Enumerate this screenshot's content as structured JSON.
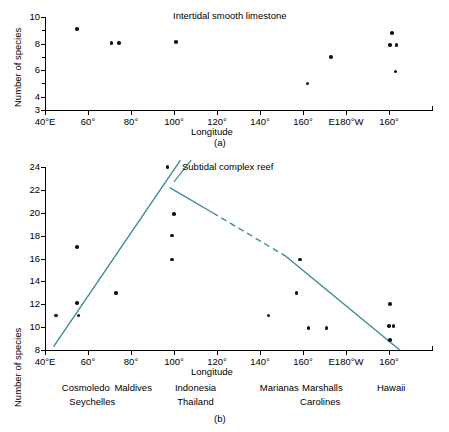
{
  "figure": {
    "panel_a_tag": "(a)",
    "panel_b_tag": "(b)"
  },
  "chart_data": [
    {
      "type": "scatter",
      "id": "panel-a",
      "title": "Intertidal smooth limestone",
      "xlabel": "Longitude",
      "ylabel": "Number of species",
      "xlim": [
        40,
        220
      ],
      "ylim": [
        3,
        10
      ],
      "grid": false,
      "legend": "none",
      "yticks": [
        3,
        4,
        6,
        8,
        10
      ],
      "ytick_labels": [
        "3",
        "4",
        "6",
        "8",
        "10"
      ],
      "yminor": [
        5,
        7,
        9
      ],
      "xticks": [
        40,
        60,
        80,
        100,
        120,
        140,
        160,
        180,
        200
      ],
      "xtick_labels": [
        "40°E",
        "60°",
        "80°",
        "100°",
        "120°",
        "140°",
        "160°",
        "E180°W",
        "160°"
      ],
      "points": [
        {
          "x": 55,
          "y": 9.1
        },
        {
          "x": 71,
          "y": 8.05
        },
        {
          "x": 74.5,
          "y": 8.05
        },
        {
          "x": 101,
          "y": 8.1
        },
        {
          "x": 162,
          "y": 5.0
        },
        {
          "x": 173,
          "y": 7.0
        },
        {
          "x": 201.5,
          "y": 8.8
        },
        {
          "x": 200.5,
          "y": 7.9
        },
        {
          "x": 203.5,
          "y": 7.9
        },
        {
          "x": 203,
          "y": 5.9
        }
      ]
    },
    {
      "type": "scatter",
      "id": "panel-b",
      "title": "Subtidal complex reef",
      "xlabel": "Longitude",
      "ylabel": "Number of species",
      "xlim": [
        40,
        220
      ],
      "ylim": [
        8,
        24
      ],
      "grid": false,
      "legend": "none",
      "yticks": [
        8,
        10,
        12,
        14,
        16,
        18,
        20,
        22,
        24
      ],
      "ytick_labels": [
        "8",
        "10",
        "12",
        "14",
        "16",
        "18",
        "20",
        "22",
        "24"
      ],
      "xticks": [
        40,
        60,
        80,
        100,
        120,
        140,
        160,
        180,
        200
      ],
      "xtick_labels": [
        "40°E",
        "60°",
        "80°",
        "100°",
        "120°",
        "140°",
        "160°",
        "E180°W",
        "160°"
      ],
      "points": [
        {
          "x": 45,
          "y": 11.0
        },
        {
          "x": 55,
          "y": 12.1
        },
        {
          "x": 55.5,
          "y": 11.0
        },
        {
          "x": 55,
          "y": 17.0
        },
        {
          "x": 73,
          "y": 13.0
        },
        {
          "x": 97,
          "y": 24.0
        },
        {
          "x": 100,
          "y": 19.9
        },
        {
          "x": 99,
          "y": 18.0
        },
        {
          "x": 99,
          "y": 15.9
        },
        {
          "x": 144,
          "y": 11.0
        },
        {
          "x": 157,
          "y": 13.0
        },
        {
          "x": 158.5,
          "y": 15.9
        },
        {
          "x": 162.5,
          "y": 9.9
        },
        {
          "x": 171,
          "y": 9.9
        },
        {
          "x": 200.5,
          "y": 12.0
        },
        {
          "x": 200,
          "y": 10.1
        },
        {
          "x": 202,
          "y": 10.1
        },
        {
          "x": 200.5,
          "y": 8.9
        }
      ],
      "trend_lines": [
        {
          "name": "ascending",
          "style": "solid",
          "x1": 44,
          "y1": 8.3,
          "x2": 103,
          "y2": 24.6
        },
        {
          "name": "descending-solid-left",
          "style": "solid",
          "x1": 98,
          "y1": 22.2,
          "x2": 118,
          "y2": 20.0
        },
        {
          "name": "descending-dashed",
          "style": "dashed",
          "x1": 118,
          "y1": 20.0,
          "x2": 152,
          "y2": 16.2
        },
        {
          "name": "descending-solid-right",
          "style": "solid",
          "x1": 152,
          "y1": 16.2,
          "x2": 205,
          "y2": 8.0
        }
      ],
      "annotation_leader": {
        "name": "reef-label-leader",
        "x1": 100,
        "y1": 22.7,
        "x2": 108,
        "y2": 24.6
      },
      "places": [
        {
          "label": "Cosmoledo",
          "x": 59
        },
        {
          "label": "Maldives",
          "x": 81
        },
        {
          "label": "Indonesia",
          "x": 110
        },
        {
          "label": "Marianas",
          "x": 149
        },
        {
          "label": "Marshalls",
          "x": 169
        },
        {
          "label": "Hawaii",
          "x": 201
        }
      ],
      "places_row2": [
        {
          "label": "Seychelles",
          "x": 62
        },
        {
          "label": "Thailand",
          "x": 110
        },
        {
          "label": "Carolines",
          "x": 168
        }
      ]
    }
  ],
  "colors": {
    "trend_line": "#3d8b97",
    "point": "#111111",
    "axis": "#000000"
  }
}
